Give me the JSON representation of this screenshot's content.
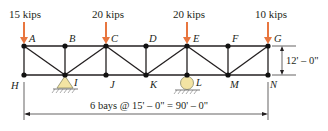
{
  "diagram": {
    "type": "truss",
    "loads": [
      {
        "node": "A",
        "label": "15 kips"
      },
      {
        "node": "C",
        "label": "20 kips"
      },
      {
        "node": "E",
        "label": "20 kips"
      },
      {
        "node": "G",
        "label": "10 kips"
      }
    ],
    "top_nodes": [
      "A",
      "B",
      "C",
      "D",
      "E",
      "F",
      "G"
    ],
    "bottom_nodes": [
      "H",
      "I",
      "J",
      "K",
      "L",
      "M",
      "N"
    ],
    "supports": [
      {
        "node": "I",
        "type": "pin"
      },
      {
        "node": "L",
        "type": "roller"
      }
    ],
    "height_dimension": "12' – 0\"",
    "span_dimension": "6 bays @ 15' – 0\" = 90' – 0\"",
    "colors": {
      "load_arrow": "#e8763f",
      "member": "#231f20",
      "pin_support": "#f3e4a3",
      "roller_support": "#f3e4a3"
    }
  }
}
